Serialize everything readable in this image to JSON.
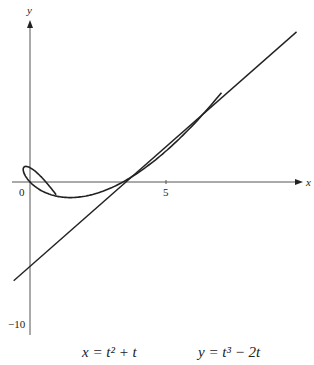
{
  "chart_data": {
    "type": "line",
    "title": "",
    "caption": {
      "x_eq": "x = t² + t",
      "y_eq": "y = t³ − 2t"
    },
    "xlabel": "x",
    "ylabel": "y",
    "x_ticks": [
      {
        "value": 0,
        "label": "0"
      },
      {
        "value": 5,
        "label": "5"
      }
    ],
    "y_ticks": [
      {
        "value": -10,
        "label": "−10"
      }
    ],
    "xlim": [
      -1,
      10
    ],
    "ylim": [
      -11,
      12
    ],
    "grid": false,
    "series": [
      {
        "name": "parametric curve",
        "t_range": [
          -1.6,
          2.2
        ],
        "x_expr": "t^2 + t",
        "y_expr": "t^3 - 2t"
      },
      {
        "name": "tangent line",
        "points": [
          [
            -0.6,
            -6.9
          ],
          [
            9.8,
            10.5
          ]
        ]
      }
    ]
  }
}
